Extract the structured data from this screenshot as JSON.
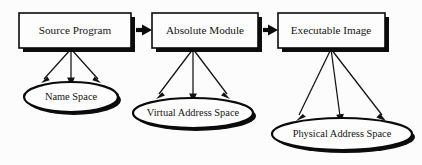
{
  "diagram": {
    "background_color": "#fcfcfc",
    "stroke_color": "#0a0a0a",
    "text_color": "#141414",
    "stages": [
      {
        "id": "source-program",
        "box_label": "Source Program",
        "space_label": "Name Space",
        "box": {
          "x": 19,
          "y": 13,
          "w": 112,
          "h": 35
        },
        "ellipse": {
          "cx": 71,
          "cy": 97,
          "rx": 47,
          "ry": 15
        },
        "fan_arrow_targets": [
          -30,
          0,
          30
        ]
      },
      {
        "id": "absolute-module",
        "box_label": "Absolute Module",
        "space_label": "Virtual Address Space",
        "box": {
          "x": 152,
          "y": 13,
          "w": 106,
          "h": 35
        },
        "ellipse": {
          "cx": 193,
          "cy": 113,
          "rx": 60,
          "ry": 15
        },
        "fan_arrow_targets": [
          -38,
          0,
          38
        ]
      },
      {
        "id": "executable-image",
        "box_label": "Executable Image",
        "space_label": "Physical Address Space",
        "box": {
          "x": 278,
          "y": 13,
          "w": 107,
          "h": 35
        },
        "ellipse": {
          "cx": 342,
          "cy": 134,
          "rx": 70,
          "ry": 16
        },
        "fan_arrow_targets": [
          -46,
          0,
          46
        ]
      }
    ],
    "connectors": [
      {
        "id": "source-to-absolute",
        "from": "source-program",
        "to": "absolute-module",
        "x1": 136,
        "x2": 150,
        "y": 30
      },
      {
        "id": "absolute-to-executable",
        "from": "absolute-module",
        "to": "executable-image",
        "x1": 263,
        "x2": 276,
        "y": 30
      }
    ]
  }
}
